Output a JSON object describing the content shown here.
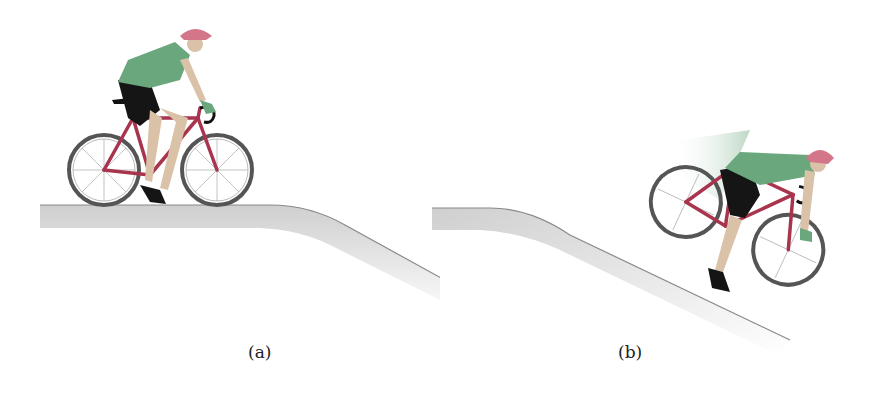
{
  "figure": {
    "panels": [
      {
        "id": "a",
        "caption": "(a)",
        "description": "Cyclist riding on level ground near the top of a hill that curves downward"
      },
      {
        "id": "b",
        "caption": "(b)",
        "description": "Cyclist riding down the slope with motion blur"
      }
    ]
  },
  "colors": {
    "jersey": "#6aa77c",
    "frame": "#a8344e",
    "helmet": "#d4768a",
    "ground": "#d9d9d9",
    "ground_edge": "#8a8a8a",
    "shorts": "#151515",
    "skin": "#d9c2a8",
    "tire": "#555555"
  }
}
